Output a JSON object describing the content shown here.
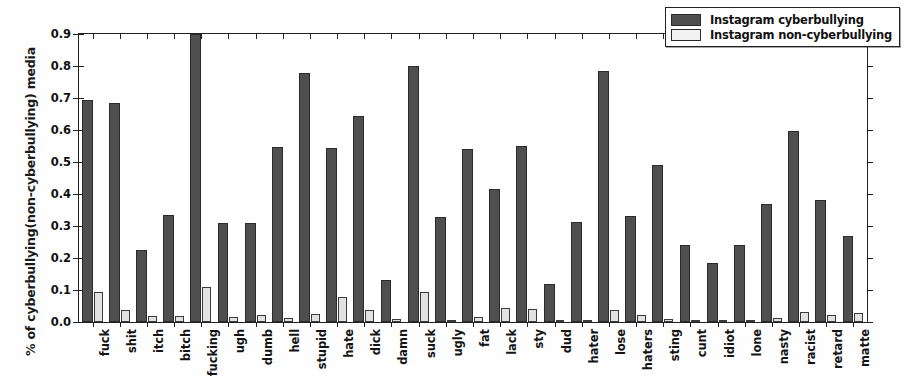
{
  "chart_data": {
    "type": "bar",
    "title": "",
    "xlabel": "",
    "ylabel": "% of cyberbullying(non-cyberbullying) media",
    "ylim": [
      0.0,
      0.9
    ],
    "yticks": [
      "0.0",
      "0.1",
      "0.2",
      "0.3",
      "0.4",
      "0.5",
      "0.6",
      "0.7",
      "0.8",
      "0.9"
    ],
    "grid": false,
    "legend_position": "upper right",
    "categories": [
      "fuck",
      "shit",
      "itch",
      "bitch",
      "fucking",
      "ugh",
      "dumb",
      "hell",
      "stupid",
      "hate",
      "dick",
      "damn",
      "suck",
      "ugly",
      "fat",
      "lack",
      "sty",
      "dud",
      "hater",
      "lose",
      "haters",
      "sting",
      "cunt",
      "idiot",
      "lone",
      "nasty",
      "racist",
      "retard",
      "matte"
    ],
    "series": [
      {
        "name": "Instagram cyberbullying",
        "color": "#4f4f4f",
        "values": [
          0.695,
          0.683,
          0.225,
          0.335,
          0.9,
          0.308,
          0.308,
          0.547,
          0.778,
          0.543,
          0.643,
          0.131,
          0.8,
          0.327,
          0.54,
          0.415,
          0.551,
          0.12,
          0.313,
          0.785,
          0.33,
          0.49,
          0.24,
          0.184,
          0.241,
          0.368,
          0.597,
          0.381,
          0.268
        ]
      },
      {
        "name": "Instagram non-cyberbullying",
        "color": "#e2e2e2",
        "values": [
          0.095,
          0.038,
          0.019,
          0.02,
          0.11,
          0.017,
          0.021,
          0.011,
          0.024,
          0.077,
          0.037,
          0.008,
          0.094,
          0.007,
          0.017,
          0.044,
          0.04,
          0.006,
          0.006,
          0.037,
          0.022,
          0.009,
          0.005,
          0.004,
          0.005,
          0.014,
          0.03,
          0.023,
          0.027
        ]
      }
    ]
  },
  "legend": {
    "entries": [
      {
        "label": "Instagram cyberbullying"
      },
      {
        "label": "Instagram non-cyberbullying"
      }
    ]
  }
}
